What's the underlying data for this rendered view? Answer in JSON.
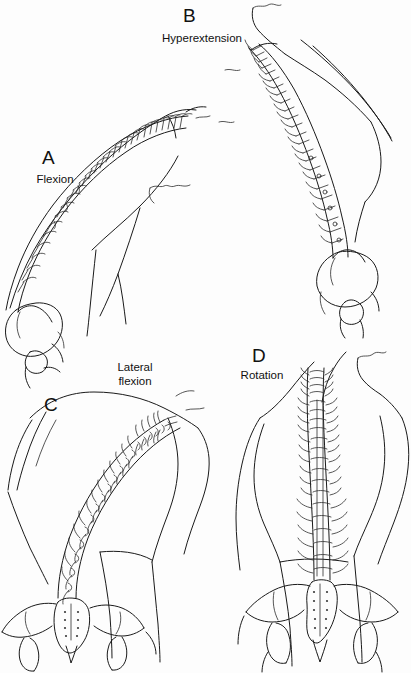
{
  "figure": {
    "background_color": "#fdfdfd",
    "ink_color": "#1a1a1a",
    "width": 411,
    "height": 673,
    "style": "black-and-white anatomical line drawing"
  },
  "panels": [
    {
      "letter": "A",
      "caption": "Flexion",
      "view": "lateral",
      "description": "Trunk bent forward; vertebral column curved into a long convex arc with cervical spine nearly horizontal, pelvis and femoral head at lower left."
    },
    {
      "letter": "B",
      "caption": "Hyperextension",
      "view": "lateral",
      "description": "Trunk arched backward; vertebral column sweeps from upper left down to pelvis at lower right, head tipped back."
    },
    {
      "letter": "C",
      "caption": "Lateral\nflexion",
      "view": "posterior",
      "description": "Trunk bent to the side; vertebral column curves diagonally from sacrum at lower left up to the shoulder girdle at upper right."
    },
    {
      "letter": "D",
      "caption": "Rotation",
      "view": "posterior",
      "description": "Trunk twisted; vertebral column runs vertically from sacrum to neck with head turned to the side."
    }
  ],
  "anatomy": {
    "structures": [
      "cervical vertebrae",
      "thoracic vertebrae",
      "lumbar vertebrae",
      "spinous processes",
      "transverse processes",
      "sacrum",
      "sacral foramina",
      "ilium",
      "iliac crest",
      "femoral head",
      "greater trochanter",
      "body surface contour"
    ]
  }
}
